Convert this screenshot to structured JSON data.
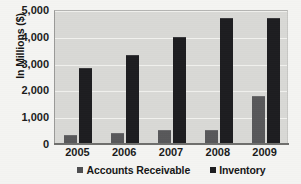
{
  "chart_data": {
    "type": "bar",
    "title": "",
    "subtitle": "",
    "xlabel": "",
    "ylabel": "In Millions ($)",
    "categories": [
      "2005",
      "2006",
      "2007",
      "2008",
      "2009"
    ],
    "series": [
      {
        "name": "Accounts Receivable",
        "color": "#58585A",
        "values": [
          350,
          420,
          520,
          520,
          1800
        ]
      },
      {
        "name": "Inventory",
        "color": "#1D1D20",
        "values": [
          2850,
          3330,
          3980,
          4700,
          4720
        ]
      }
    ],
    "ylim": [
      0,
      5000
    ],
    "ytick_values": [
      0,
      1000,
      2000,
      3000,
      4000,
      5000
    ],
    "ytick_labels": [
      "0",
      "1,000",
      "2,000",
      "3,000",
      "4,000",
      "5,000"
    ],
    "grid": true,
    "grid_orientation": "horizontal",
    "legend": true,
    "legend_position": "bottom-center",
    "legend_entries": [
      "Accounts Receivable",
      "Inventory"
    ],
    "plot_background": "#D9D9D6",
    "figure_background": "#F4F4F2"
  }
}
